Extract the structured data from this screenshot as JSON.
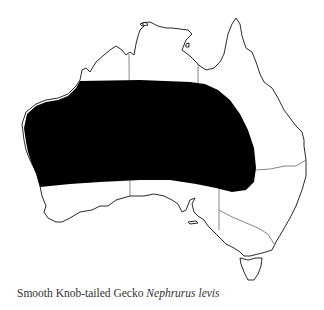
{
  "caption": {
    "common_name": "Smooth Knob-tailed Gecko",
    "scientific_name": "Nephrurus levis"
  },
  "map": {
    "region": "Australia",
    "range_color": "#000000",
    "outline_color": "#2a2a2a"
  }
}
